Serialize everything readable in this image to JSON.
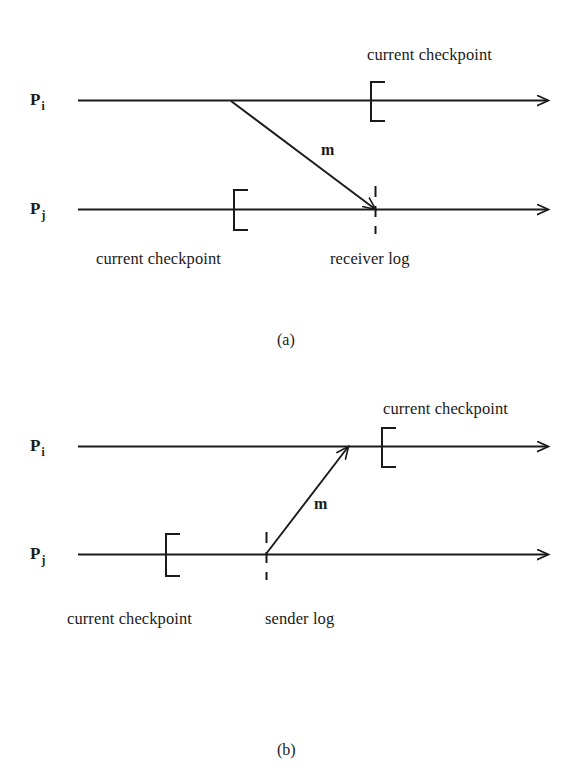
{
  "figure": {
    "type": "message-logging-checkpoint-timeline-diagram",
    "panels": [
      {
        "id": "a",
        "caption": "(a)",
        "scenario": "receiver logging",
        "processes": [
          {
            "name": "P",
            "subscript": "i",
            "role": "sender"
          },
          {
            "name": "P",
            "subscript": "j",
            "role": "receiver"
          }
        ],
        "message": {
          "label": "m",
          "direction": "down-right",
          "from_process": "P_i",
          "to_process": "P_j"
        },
        "annotations": [
          {
            "id": "cp-top",
            "text": "current checkpoint",
            "on": "P_i",
            "marker": "checkpoint-bracket"
          },
          {
            "id": "cp-bottom",
            "text": "current checkpoint",
            "on": "P_j",
            "marker": "checkpoint-bracket"
          },
          {
            "id": "log",
            "text": "receiver log",
            "on": "P_j",
            "marker": "log-dashed-line"
          }
        ]
      },
      {
        "id": "b",
        "caption": "(b)",
        "scenario": "sender logging",
        "processes": [
          {
            "name": "P",
            "subscript": "i",
            "role": "receiver"
          },
          {
            "name": "P",
            "subscript": "j",
            "role": "sender"
          }
        ],
        "message": {
          "label": "m",
          "direction": "up-right",
          "from_process": "P_j",
          "to_process": "P_i"
        },
        "annotations": [
          {
            "id": "cp-top",
            "text": "current checkpoint",
            "on": "P_i",
            "marker": "checkpoint-bracket"
          },
          {
            "id": "cp-bottom",
            "text": "current checkpoint",
            "on": "P_j",
            "marker": "checkpoint-bracket"
          },
          {
            "id": "log",
            "text": "sender log",
            "on": "P_j",
            "marker": "log-dashed-line"
          }
        ]
      }
    ]
  },
  "colors": {
    "ink": "#1a1a1a",
    "background": "#ffffff"
  },
  "panel_a": {
    "pi_label": "P",
    "pi_sub": "i",
    "pj_label": "P",
    "pj_sub": "j",
    "checkpoint_top": "current checkpoint",
    "checkpoint_bottom": "current checkpoint",
    "log_label": "receiver log",
    "message_label": "m",
    "caption": "(a)"
  },
  "panel_b": {
    "pi_label": "P",
    "pi_sub": "i",
    "pj_label": "P",
    "pj_sub": "j",
    "checkpoint_top": "current checkpoint",
    "checkpoint_bottom": "current checkpoint",
    "log_label": "sender log",
    "message_label": "m",
    "caption": "(b)"
  }
}
